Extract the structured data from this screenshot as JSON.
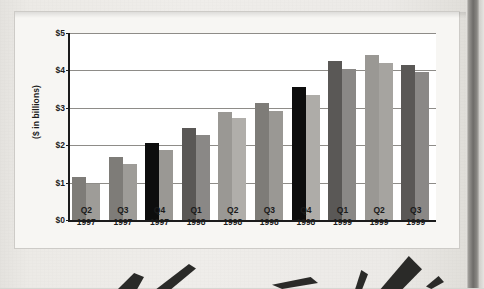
{
  "chart_data": {
    "type": "bar",
    "title": "",
    "subtitle": "",
    "xlabel": "",
    "ylabel": "($ in billions)",
    "ylim": [
      0,
      5
    ],
    "ytick_labels": [
      "$0",
      "$1",
      "$2",
      "$3",
      "$4",
      "$5"
    ],
    "ytick_values": [
      0,
      1,
      2,
      3,
      4,
      5
    ],
    "grid": true,
    "legend": "none",
    "categories": [
      "Q2 1997",
      "Q3 1997",
      "Q4 1997",
      "Q1 1998",
      "Q2 1998",
      "Q3 1998",
      "Q4 1998",
      "Q1 1999",
      "Q2 1999",
      "Q3 1999"
    ],
    "category_lines": [
      {
        "quarter": "Q2",
        "year": "1997"
      },
      {
        "quarter": "Q3",
        "year": "1997"
      },
      {
        "quarter": "Q4",
        "year": "1997"
      },
      {
        "quarter": "Q1",
        "year": "1998"
      },
      {
        "quarter": "Q2",
        "year": "1998"
      },
      {
        "quarter": "Q3",
        "year": "1998"
      },
      {
        "quarter": "Q4",
        "year": "1998"
      },
      {
        "quarter": "Q1",
        "year": "1999"
      },
      {
        "quarter": "Q2",
        "year": "1999"
      },
      {
        "quarter": "Q3",
        "year": "1999"
      }
    ],
    "series": [
      {
        "name": "Series A",
        "values": [
          1.15,
          1.68,
          2.05,
          2.45,
          2.9,
          3.12,
          3.55,
          4.25,
          4.4,
          4.15
        ],
        "colors": [
          "#7e7c78",
          "#7e7c78",
          "#0d0d0d",
          "#5a5856",
          "#9a9894",
          "#7e7c78",
          "#0d0d0d",
          "#5a5856",
          "#9a9894",
          "#5a5856"
        ]
      },
      {
        "name": "Series B",
        "values": [
          0.97,
          1.49,
          1.87,
          2.27,
          2.72,
          2.92,
          3.35,
          4.05,
          4.2,
          3.95
        ],
        "colors": [
          "#9e9c98",
          "#9e9c98",
          "#9a9894",
          "#8a8886",
          "#b0aeaa",
          "#9a9894",
          "#aeaca8",
          "#8a8886",
          "#a6a4a0",
          "#8a8886"
        ]
      }
    ],
    "axis_color": "#1b1b1b",
    "grid_color": "#8e8c88",
    "plot_background": "#ffffff"
  },
  "page": {
    "card_background": "#f7f6f3",
    "paper_background": "#eceae6",
    "gutter_color": "#6e6c69"
  }
}
